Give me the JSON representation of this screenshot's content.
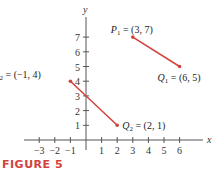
{
  "figure": {
    "label": "FIGURE 5",
    "label_color": "#d2413a"
  },
  "chart_data": {
    "type": "scatter",
    "title": "",
    "xlabel": "x",
    "ylabel": "y",
    "xlim": [
      -3.5,
      7
    ],
    "ylim": [
      0,
      8
    ],
    "grid": false,
    "x_ticks": [
      -3,
      -2,
      -1,
      1,
      2,
      3,
      4,
      5,
      6
    ],
    "x_tick_labels": [
      "−3",
      "−2",
      "−1",
      "1",
      "2",
      "3",
      "4",
      "5",
      "6"
    ],
    "y_ticks": [
      1,
      2,
      3,
      4,
      5,
      6,
      7
    ],
    "y_tick_labels": [
      "1",
      "2",
      "3",
      "4",
      "5",
      "6",
      "7"
    ],
    "segment_color": "#d2413a",
    "axis_color": "#555555",
    "series": [
      {
        "name": "P1Q1",
        "points": [
          {
            "x": 3,
            "y": 7,
            "label_name": "P",
            "label_sub": "1",
            "label_value": " = (3, 7)"
          },
          {
            "x": 6,
            "y": 5,
            "label_name": "Q",
            "label_sub": "1",
            "label_value": " = (6, 5)"
          }
        ]
      },
      {
        "name": "P2Q2",
        "points": [
          {
            "x": -1,
            "y": 4,
            "label_name": "P",
            "label_sub": "2",
            "label_value": " = (−1, 4)"
          },
          {
            "x": 2,
            "y": 1,
            "label_name": "Q",
            "label_sub": "2",
            "label_value": " = (2, 1)"
          }
        ]
      }
    ]
  }
}
